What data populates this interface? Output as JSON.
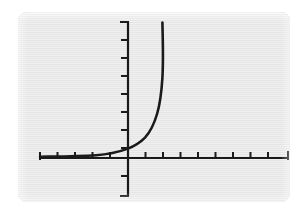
{
  "figure": {
    "kind": "graph-panel",
    "panel_background_color": "#e9e9e9",
    "page_background_color": "#ffffff",
    "ink_color": "#1a1a1a",
    "panel": {
      "x": 18,
      "y": 12,
      "width": 272,
      "height": 190,
      "corner_radius": 9
    }
  },
  "chart_data": {
    "type": "line",
    "title": "",
    "subtitle": "",
    "xlabel": "",
    "ylabel": "",
    "grid": false,
    "legend": null,
    "legend_position": "none",
    "annotations": [],
    "axes": {
      "origin_px": {
        "x": 128,
        "y": 158
      },
      "x_axis": {
        "start_px": 40,
        "end_px": 288,
        "y_px": 158,
        "tick_spacing_px": 17.5,
        "tick_length_px": 7,
        "tick_direction": "up",
        "end_caps": true,
        "tick_labels": []
      },
      "y_axis": {
        "top_px": 22,
        "bottom_px": 196,
        "x_px": 128,
        "tick_spacing_px": 17.5,
        "tick_length_px": 7,
        "tick_direction": "left",
        "end_caps": true,
        "tick_labels": []
      },
      "xlim": [
        -5,
        9.2
      ],
      "ylim": [
        -2.2,
        7.8
      ]
    },
    "series": [
      {
        "name": "exponential-curve",
        "color": "#1a1a1a",
        "line_width_px": 2.6,
        "x": [
          -5.0,
          -4.5,
          -4.0,
          -3.5,
          -3.0,
          -2.5,
          -2.0,
          -1.5,
          -1.0,
          -0.5,
          0.0,
          0.25,
          0.5,
          0.75,
          1.0,
          1.25,
          1.5,
          1.75,
          1.9
        ],
        "y": [
          0.03,
          0.04,
          0.06,
          0.09,
          0.13,
          0.18,
          0.26,
          0.37,
          0.53,
          0.74,
          1.05,
          1.25,
          1.48,
          1.76,
          2.09,
          2.48,
          2.95,
          3.5,
          3.85
        ],
        "y_intercept": 1.05
      }
    ]
  },
  "curve_path": "M 40 156.8 C 62 156.4 80 156.2 96 155.2 C 108 154.4 118 152.2 128 148.6 C 135 145.8 140.5 142.2 145 137.6 C 150 132.2 154 124.5 157.2 113.5 C 160 104 161.5 92 162.4 78 C 163.2 64.5 163.0 44 162.4 22.5"
}
